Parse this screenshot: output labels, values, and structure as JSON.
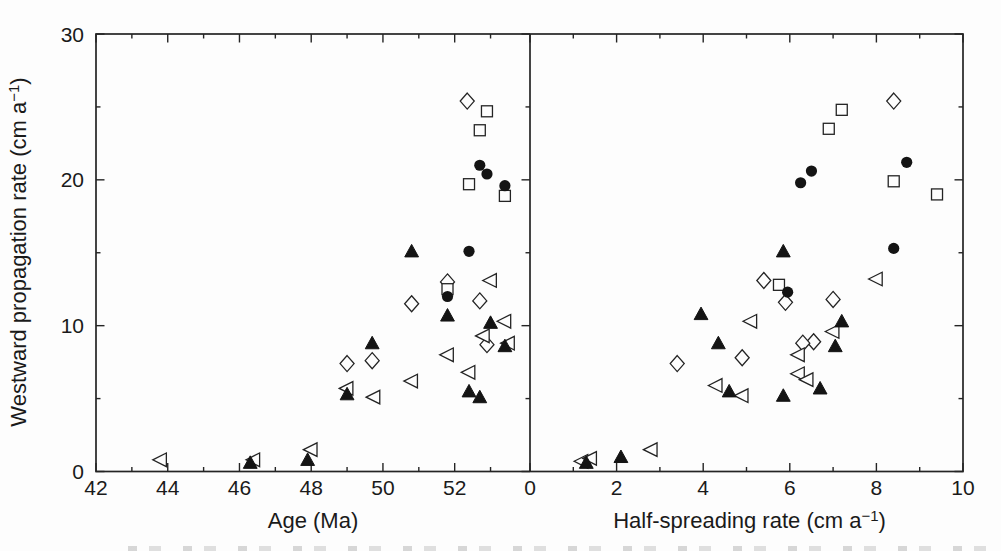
{
  "figure": {
    "background": "#fdfdfd",
    "ink": "#242424",
    "caption_fragment_visible": true
  },
  "axes_shared": {
    "ylabel": "Westward propagation rate (cm a⁻¹)",
    "ylabel_base": "Westward propagation rate (cm a",
    "ylabel_exp": "−1",
    "ylabel_close": ")",
    "ylim": [
      0,
      30
    ],
    "yticks_major": [
      0,
      10,
      20,
      30
    ],
    "ytick_labels": [
      "0",
      "10",
      "20",
      "30"
    ],
    "yticks_minor": [
      5,
      15,
      25
    ]
  },
  "chart_data": [
    {
      "type": "scatter",
      "panel": "left",
      "xlabel": "Age (Ma)",
      "xlabel_base": "Age (Ma)",
      "xlabel_exp": "",
      "xlabel_close": "",
      "xlim": [
        42,
        54.1
      ],
      "ylim": [
        0,
        30
      ],
      "xticks_major": [
        42,
        44,
        46,
        48,
        50,
        52
      ],
      "xtick_labels": [
        "42",
        "44",
        "46",
        "48",
        "50",
        "52"
      ],
      "xticks_minor": [
        43,
        45,
        47,
        49,
        51,
        53
      ],
      "series": [
        {
          "name": "open-diamond",
          "marker": "diamond-open",
          "points": [
            [
              52.35,
              25.4
            ],
            [
              51.8,
              13.0
            ],
            [
              52.7,
              11.7
            ],
            [
              50.8,
              11.5
            ],
            [
              52.9,
              8.7
            ],
            [
              49.7,
              7.6
            ],
            [
              49.0,
              7.4
            ]
          ]
        },
        {
          "name": "open-square",
          "marker": "square-open",
          "points": [
            [
              52.9,
              24.7
            ],
            [
              52.7,
              23.4
            ],
            [
              52.4,
              19.7
            ],
            [
              53.4,
              18.9
            ],
            [
              51.8,
              12.5
            ]
          ]
        },
        {
          "name": "open-left-triangle",
          "marker": "triangle-left-open",
          "points": [
            [
              43.8,
              0.8
            ],
            [
              46.4,
              0.8
            ],
            [
              48.0,
              1.5
            ],
            [
              49.0,
              5.7
            ],
            [
              49.75,
              5.1
            ],
            [
              50.8,
              6.2
            ],
            [
              51.8,
              8.0
            ],
            [
              52.4,
              6.8
            ],
            [
              52.8,
              9.3
            ],
            [
              53.0,
              13.1
            ],
            [
              53.4,
              10.3
            ],
            [
              53.5,
              8.8
            ]
          ]
        },
        {
          "name": "filled-triangle",
          "marker": "triangle-up-filled",
          "points": [
            [
              46.3,
              0.6
            ],
            [
              47.9,
              0.8
            ],
            [
              49.0,
              5.3
            ],
            [
              49.7,
              8.8
            ],
            [
              50.8,
              15.1
            ],
            [
              51.8,
              10.7
            ],
            [
              52.4,
              5.5
            ],
            [
              52.7,
              5.1
            ],
            [
              53.0,
              10.2
            ],
            [
              53.4,
              8.6
            ]
          ]
        },
        {
          "name": "filled-circle",
          "marker": "circle-filled",
          "points": [
            [
              52.7,
              21.0
            ],
            [
              52.9,
              20.4
            ],
            [
              53.4,
              19.6
            ],
            [
              52.4,
              15.1
            ],
            [
              51.8,
              12.0
            ]
          ]
        }
      ]
    },
    {
      "type": "scatter",
      "panel": "right",
      "xlabel": "Half-spreading rate (cm a⁻¹)",
      "xlabel_base": "Half-spreading rate (cm a",
      "xlabel_exp": "−1",
      "xlabel_close": ")",
      "xlim": [
        0,
        10
      ],
      "ylim": [
        0,
        30
      ],
      "xticks_major": [
        0,
        2,
        4,
        6,
        8,
        10
      ],
      "xtick_labels": [
        "0",
        "2",
        "4",
        "6",
        "8",
        "10"
      ],
      "xticks_minor": [
        1,
        3,
        5,
        7,
        9
      ],
      "series": [
        {
          "name": "open-diamond",
          "marker": "diamond-open",
          "points": [
            [
              8.4,
              25.4
            ],
            [
              5.4,
              13.1
            ],
            [
              7.0,
              11.8
            ],
            [
              5.9,
              11.6
            ],
            [
              6.55,
              8.9
            ],
            [
              6.3,
              8.8
            ],
            [
              4.9,
              7.8
            ],
            [
              3.4,
              7.4
            ]
          ]
        },
        {
          "name": "open-square",
          "marker": "square-open",
          "points": [
            [
              7.2,
              24.8
            ],
            [
              6.9,
              23.5
            ],
            [
              8.4,
              19.9
            ],
            [
              9.4,
              19.0
            ],
            [
              5.75,
              12.8
            ]
          ]
        },
        {
          "name": "open-left-triangle",
          "marker": "triangle-left-open",
          "points": [
            [
              1.2,
              0.7
            ],
            [
              1.4,
              0.9
            ],
            [
              2.8,
              1.5
            ],
            [
              4.3,
              5.9
            ],
            [
              4.9,
              5.2
            ],
            [
              5.1,
              10.3
            ],
            [
              6.2,
              8.0
            ],
            [
              6.2,
              6.7
            ],
            [
              6.4,
              6.3
            ],
            [
              7.0,
              9.6
            ],
            [
              8.0,
              13.2
            ]
          ]
        },
        {
          "name": "filled-triangle",
          "marker": "triangle-up-filled",
          "points": [
            [
              1.3,
              0.6
            ],
            [
              2.1,
              1.0
            ],
            [
              3.95,
              10.8
            ],
            [
              4.35,
              8.8
            ],
            [
              4.6,
              5.5
            ],
            [
              5.85,
              5.2
            ],
            [
              5.85,
              15.1
            ],
            [
              6.7,
              5.7
            ],
            [
              7.05,
              8.6
            ],
            [
              7.2,
              10.3
            ]
          ]
        },
        {
          "name": "filled-circle",
          "marker": "circle-filled",
          "points": [
            [
              6.25,
              19.8
            ],
            [
              6.5,
              20.6
            ],
            [
              8.7,
              21.2
            ],
            [
              8.4,
              15.3
            ],
            [
              5.95,
              12.3
            ]
          ]
        }
      ]
    }
  ]
}
